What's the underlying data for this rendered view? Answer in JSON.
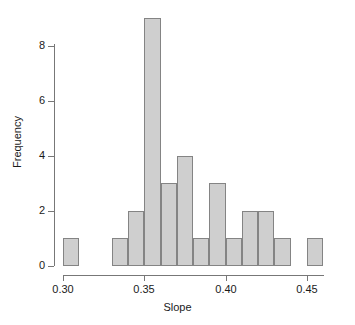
{
  "chart_data": {
    "type": "bar",
    "title": "",
    "xlabel": "Slope",
    "ylabel": "Frequency",
    "xlim": [
      0.3,
      0.46
    ],
    "ylim": [
      0,
      9
    ],
    "grid": false,
    "legend": null,
    "bin_width": 0.01,
    "bin_edges": [
      0.3,
      0.31,
      0.32,
      0.33,
      0.34,
      0.35,
      0.36,
      0.37,
      0.38,
      0.39,
      0.4,
      0.41,
      0.42,
      0.43,
      0.44,
      0.45,
      0.46
    ],
    "categories": [
      "0.30-0.31",
      "0.31-0.32",
      "0.32-0.33",
      "0.33-0.34",
      "0.34-0.35",
      "0.35-0.36",
      "0.36-0.37",
      "0.37-0.38",
      "0.38-0.39",
      "0.39-0.40",
      "0.40-0.41",
      "0.41-0.42",
      "0.42-0.43",
      "0.43-0.44",
      "0.44-0.45",
      "0.45-0.46"
    ],
    "values": [
      1,
      0,
      0,
      1,
      2,
      9,
      3,
      4,
      1,
      3,
      1,
      2,
      2,
      1,
      0,
      1
    ],
    "x_ticks": [
      0.3,
      0.35,
      0.4,
      0.45
    ],
    "x_tick_labels": [
      "0.30",
      "0.35",
      "0.40",
      "0.45"
    ],
    "y_ticks": [
      0,
      2,
      4,
      6,
      8
    ],
    "y_tick_labels": [
      "0",
      "2",
      "4",
      "6",
      "8"
    ],
    "bar_fill_color": "#cfcfcf",
    "bar_border_color": "#848484",
    "axis_color": "#777777",
    "text_color": "#1a1a1a",
    "background_color": "#ffffff"
  }
}
